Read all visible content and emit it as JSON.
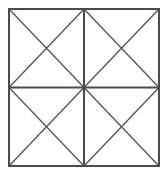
{
  "figure": {
    "title": "Square subdivided into four sub-squares each with both diagonals",
    "type": "geometric-line-diagram",
    "background_color": "#ffffff",
    "line_color": "#4a4a52",
    "diagonal_color": "#55555d",
    "frame_stroke_width": 2,
    "diagonal_stroke_width": 1.35,
    "canvas": {
      "width": 167,
      "height": 173
    },
    "square": {
      "left": 9,
      "top": 9,
      "right": 159,
      "bottom": 166,
      "width": 150,
      "height": 157,
      "center_x": 84,
      "center_y": 87.5
    },
    "counts": {
      "sub_squares": 4,
      "triangles": 16,
      "total_line_segments": 12,
      "vertices": 9
    },
    "segments": [
      {
        "name": "outer-top",
        "x1": 9,
        "y1": 9,
        "x2": 159,
        "y2": 9,
        "kind": "frame"
      },
      {
        "name": "outer-right",
        "x1": 159,
        "y1": 9,
        "x2": 159,
        "y2": 166,
        "kind": "frame"
      },
      {
        "name": "outer-bottom",
        "x1": 159,
        "y1": 166,
        "x2": 9,
        "y2": 166,
        "kind": "frame"
      },
      {
        "name": "outer-left",
        "x1": 9,
        "y1": 166,
        "x2": 9,
        "y2": 9,
        "kind": "frame"
      },
      {
        "name": "vertical-midline",
        "x1": 84,
        "y1": 9,
        "x2": 84,
        "y2": 166,
        "kind": "mid"
      },
      {
        "name": "horizontal-midline",
        "x1": 9,
        "y1": 87.5,
        "x2": 159,
        "y2": 87.5,
        "kind": "mid"
      },
      {
        "name": "main-diagonal-tl-br",
        "x1": 9,
        "y1": 9,
        "x2": 159,
        "y2": 166,
        "kind": "diagonal"
      },
      {
        "name": "main-diagonal-tr-bl",
        "x1": 159,
        "y1": 9,
        "x2": 9,
        "y2": 166,
        "kind": "diagonal"
      },
      {
        "name": "antidiagonal-top-left-quadrant",
        "x1": 84,
        "y1": 9,
        "x2": 9,
        "y2": 87.5,
        "kind": "diagonal"
      },
      {
        "name": "antidiagonal-top-right-quadrant",
        "x1": 84,
        "y1": 9,
        "x2": 159,
        "y2": 87.5,
        "kind": "diagonal"
      },
      {
        "name": "antidiagonal-bottom-left-quadrant",
        "x1": 9,
        "y1": 87.5,
        "x2": 84,
        "y2": 166,
        "kind": "diagonal"
      },
      {
        "name": "antidiagonal-bottom-right-quadrant",
        "x1": 159,
        "y1": 87.5,
        "x2": 84,
        "y2": 166,
        "kind": "diagonal"
      }
    ]
  }
}
